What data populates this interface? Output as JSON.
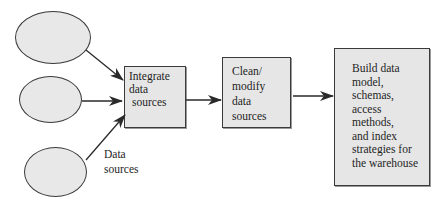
{
  "diagram": {
    "type": "data warehouse build flow",
    "sources": {
      "count": 3,
      "label_lines": [
        "Data",
        "sources"
      ]
    },
    "steps": [
      {
        "id": "integrate",
        "lines": [
          "Integrate",
          "data",
          "sources"
        ]
      },
      {
        "id": "clean",
        "lines": [
          "Clean/",
          "modify",
          "data",
          "sources"
        ]
      },
      {
        "id": "build",
        "lines": [
          "Build data",
          "model,",
          "schemas,",
          "access",
          "methods,",
          "and index",
          "strategies for",
          "the warehouse"
        ]
      }
    ],
    "edges": [
      {
        "from": "source-1",
        "to": "integrate"
      },
      {
        "from": "source-2",
        "to": "integrate"
      },
      {
        "from": "source-3",
        "to": "integrate"
      },
      {
        "from": "integrate",
        "to": "clean"
      },
      {
        "from": "clean",
        "to": "build"
      }
    ],
    "colors": {
      "shape_fill": "#e6e6e6",
      "stroke": "#3a3a3a",
      "text": "#1e1e1e"
    }
  }
}
